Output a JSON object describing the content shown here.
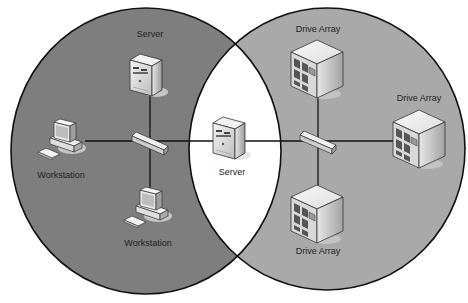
{
  "diagram": {
    "type": "venn-network",
    "colors": {
      "left_region": "#7e7e7e",
      "right_region": "#a9a9a9",
      "intersection": "#ffffff",
      "outline": "#111111",
      "link": "#111111"
    },
    "regions": [
      {
        "id": "left",
        "description": "Workstation / server segment"
      },
      {
        "id": "right",
        "description": "Storage segment"
      },
      {
        "id": "overlap",
        "description": "Shared server"
      }
    ],
    "nodes": [
      {
        "id": "server-top",
        "label": "Server",
        "icon": "server-tower-icon"
      },
      {
        "id": "workstation-left",
        "label": "Workstation",
        "icon": "workstation-icon"
      },
      {
        "id": "workstation-bottom",
        "label": "Workstation",
        "icon": "workstation-icon"
      },
      {
        "id": "switch-left",
        "label": "",
        "icon": "network-switch-icon"
      },
      {
        "id": "server-center",
        "label": "Server",
        "icon": "server-tower-icon"
      },
      {
        "id": "switch-right",
        "label": "",
        "icon": "network-switch-icon"
      },
      {
        "id": "drive-array-top",
        "label": "Drive Array",
        "icon": "drive-array-icon"
      },
      {
        "id": "drive-array-right",
        "label": "Drive Array",
        "icon": "drive-array-icon"
      },
      {
        "id": "drive-array-bottom",
        "label": "Drive Array",
        "icon": "drive-array-icon"
      }
    ],
    "edges": [
      [
        "server-top",
        "switch-left"
      ],
      [
        "workstation-left",
        "switch-left"
      ],
      [
        "workstation-bottom",
        "switch-left"
      ],
      [
        "switch-left",
        "server-center"
      ],
      [
        "server-center",
        "switch-right"
      ],
      [
        "switch-right",
        "drive-array-top"
      ],
      [
        "switch-right",
        "drive-array-right"
      ],
      [
        "switch-right",
        "drive-array-bottom"
      ]
    ]
  }
}
